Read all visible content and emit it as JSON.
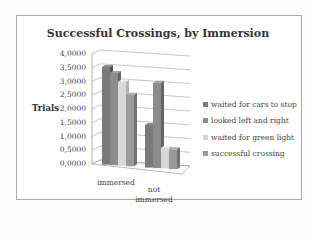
{
  "chart_data": {
    "type": "bar",
    "title": "Successful Crossings, by Immersion",
    "xlabel": "",
    "ylabel": "Trials",
    "ylim": [
      0,
      4
    ],
    "yticks": [
      "4,0000",
      "3,5000",
      "3,0000",
      "2,5000",
      "2,0000",
      "1,5000",
      "1,0000",
      "0,5000",
      "0,0000"
    ],
    "categories": [
      "immersed",
      "not immersed"
    ],
    "series": [
      {
        "name": "waited for cars to stop",
        "values": [
          3.55,
          1.55
        ],
        "color": "#7a7a7a"
      },
      {
        "name": "looked left and right",
        "values": [
          3.35,
          3.1
        ],
        "color": "#8c8c8c"
      },
      {
        "name": "waited for green light",
        "values": [
          3.05,
          0.75
        ],
        "color": "#d8d8d8"
      },
      {
        "name": "successful crossing",
        "values": [
          2.6,
          0.72
        ],
        "color": "#9a9a9a"
      }
    ],
    "grid": true,
    "legend_position": "right",
    "style": "3d-clustered-column"
  }
}
